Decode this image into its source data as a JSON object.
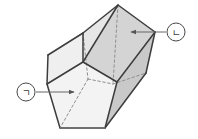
{
  "figure": {
    "kind": "pentagonal-prism-3d-diagram",
    "background_color": "#ffffff",
    "outline_color": "#3c3c3c",
    "hidden_edge_color": "#8a8a8a",
    "leader_line_color": "#666666",
    "faces": {
      "front_pentagon_fill": "#f2f2f2",
      "top_left_quad_fill": "#e8e8e8",
      "top_right_quad_fill": "#d6d6d6",
      "right_side_quad_fill": "#cfcfcf",
      "lower_right_quad_fill": "#c8c8c8",
      "left_sliver_fill": "#efefef"
    }
  },
  "annotations": [
    {
      "id": "label-giyeok",
      "symbol": "ㄱ",
      "position": "left",
      "circle": {
        "cx": 26,
        "cy": 92,
        "r": 9
      },
      "leader": {
        "x1": 36,
        "y1": 92,
        "x2": 76,
        "y2": 92
      },
      "arrow_direction": "right",
      "points_at": "front-pentagon-face"
    },
    {
      "id": "label-nieun",
      "symbol": "ㄴ",
      "position": "right",
      "circle": {
        "cx": 176,
        "cy": 32,
        "r": 9
      },
      "leader": {
        "x1": 166,
        "y1": 32,
        "x2": 129,
        "y2": 32
      },
      "arrow_direction": "left",
      "points_at": "upper-right-lateral-face"
    }
  ],
  "geometry": {
    "front_pentagon": [
      [
        47,
        84
      ],
      [
        83,
        62
      ],
      [
        117,
        82
      ],
      [
        105,
        128
      ],
      [
        60,
        128
      ]
    ],
    "back_pentagon": [
      [
        83,
        33
      ],
      [
        118,
        5
      ],
      [
        155,
        32
      ],
      [
        146,
        73
      ],
      [
        100,
        84
      ]
    ]
  }
}
